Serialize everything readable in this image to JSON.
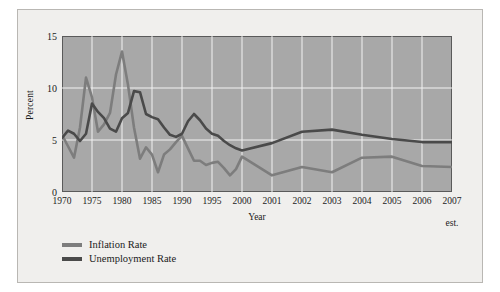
{
  "chart_data": {
    "type": "line",
    "title": "",
    "xlabel": "Year",
    "ylabel": "Percent",
    "ylim": [
      0,
      15
    ],
    "yticks": [
      0,
      5,
      10,
      15
    ],
    "grid": true,
    "legend_position": "below-left",
    "xtick_labels": [
      "1970",
      "1975",
      "1980",
      "1985",
      "1990",
      "1995",
      "2000",
      "2001",
      "2002",
      "2003",
      "2004",
      "2005",
      "2006",
      "2007"
    ],
    "xtick_sublabels": [
      "",
      "",
      "",
      "",
      "",
      "",
      "",
      "",
      "",
      "",
      "",
      "",
      "",
      "est."
    ],
    "x_positions": [
      1970,
      1975,
      1980,
      1985,
      1990,
      1995,
      2000,
      2001,
      2002,
      2003,
      2004,
      2005,
      2006,
      2007
    ],
    "x_note": "axis is compressed: 1970-2000 at 5-year spacing, then yearly 2000-2007",
    "series": [
      {
        "name": "Inflation Rate",
        "color": "#7d7d7d",
        "x": [
          1970,
          1971,
          1972,
          1973,
          1974,
          1975,
          1976,
          1977,
          1978,
          1979,
          1980,
          1981,
          1982,
          1983,
          1984,
          1985,
          1986,
          1987,
          1988,
          1989,
          1990,
          1991,
          1992,
          1993,
          1994,
          1995,
          1996,
          1997,
          1998,
          1999,
          2000,
          2001,
          2002,
          2003,
          2004,
          2005,
          2006,
          2007
        ],
        "values": [
          5.5,
          4.4,
          3.3,
          6.2,
          11.0,
          9.1,
          5.8,
          6.5,
          7.6,
          11.3,
          13.5,
          10.3,
          6.2,
          3.2,
          4.3,
          3.6,
          1.9,
          3.6,
          4.1,
          4.8,
          5.4,
          4.2,
          3.0,
          3.0,
          2.6,
          2.8,
          2.9,
          2.3,
          1.6,
          2.2,
          3.4,
          1.6,
          2.4,
          1.9,
          3.3,
          3.4,
          2.5,
          2.4
        ],
        "notable_points": {
          "peak_1980": 13.5,
          "peak_1974": 11.0,
          "trough_1986": 1.9,
          "trough_2001": 1.6
        }
      },
      {
        "name": "Unemployment Rate",
        "color": "#4a4a4a",
        "x": [
          1970,
          1971,
          1972,
          1973,
          1974,
          1975,
          1976,
          1977,
          1978,
          1979,
          1980,
          1981,
          1982,
          1983,
          1984,
          1985,
          1986,
          1987,
          1988,
          1989,
          1990,
          1991,
          1992,
          1993,
          1994,
          1995,
          1996,
          1997,
          1998,
          1999,
          2000,
          2001,
          2002,
          2003,
          2004,
          2005,
          2006,
          2007
        ],
        "values": [
          5.2,
          5.9,
          5.6,
          4.9,
          5.6,
          8.5,
          7.7,
          7.1,
          6.1,
          5.8,
          7.1,
          7.6,
          9.7,
          9.6,
          7.5,
          7.2,
          7.0,
          6.2,
          5.5,
          5.3,
          5.6,
          6.8,
          7.5,
          6.9,
          6.1,
          5.6,
          5.4,
          4.9,
          4.5,
          4.2,
          4.0,
          4.7,
          5.8,
          6.0,
          5.5,
          5.1,
          4.8,
          4.8
        ],
        "notable_points": {
          "peak_1982": 9.7,
          "peak_1975": 8.5,
          "peak_1992": 7.5,
          "trough_2000": 4.0
        }
      }
    ]
  },
  "legend": {
    "items": [
      {
        "label": "Inflation Rate",
        "color": "#7d7d7d"
      },
      {
        "label": "Unemployment Rate",
        "color": "#4a4a4a"
      }
    ]
  },
  "axes": {
    "y_title": "Percent",
    "x_title": "Year",
    "y_ticks": [
      "15",
      "10",
      "5",
      "0"
    ],
    "x_ticks": [
      {
        "label": "1970",
        "sub": ""
      },
      {
        "label": "1975",
        "sub": ""
      },
      {
        "label": "1980",
        "sub": ""
      },
      {
        "label": "1985",
        "sub": ""
      },
      {
        "label": "1990",
        "sub": ""
      },
      {
        "label": "1995",
        "sub": ""
      },
      {
        "label": "2000",
        "sub": ""
      },
      {
        "label": "2001",
        "sub": ""
      },
      {
        "label": "2002",
        "sub": ""
      },
      {
        "label": "2003",
        "sub": ""
      },
      {
        "label": "2004",
        "sub": ""
      },
      {
        "label": "2005",
        "sub": ""
      },
      {
        "label": "2006",
        "sub": ""
      },
      {
        "label": "2007",
        "sub": "est."
      }
    ]
  },
  "colors": {
    "plot_background": "#a8a8a8",
    "card_background": "#f0efed",
    "gridline": "#f2f2f2",
    "frame": "#5a5a5a",
    "inflation": "#7d7d7d",
    "unemployment": "#4a4a4a",
    "text": "#1b1b1b"
  }
}
